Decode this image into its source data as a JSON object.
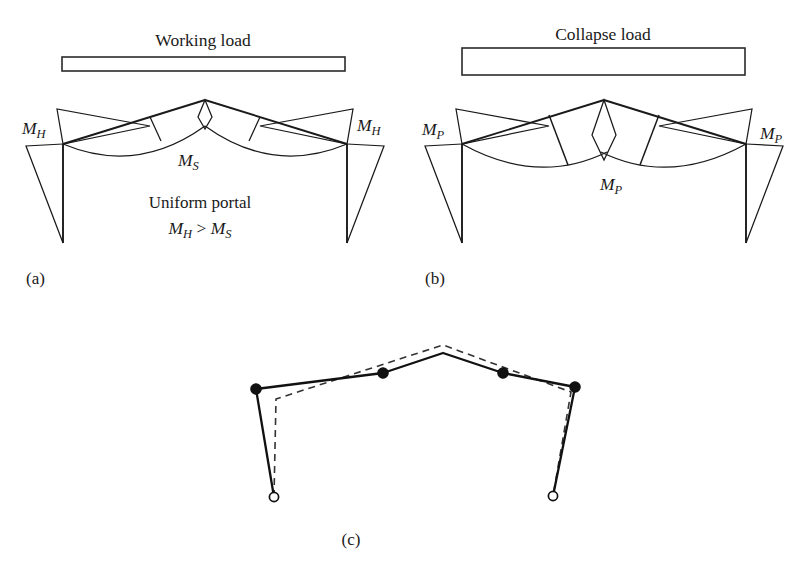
{
  "figure": {
    "domain": "engineering-diagram",
    "background": "#ffffff",
    "ink": "#1a1a1a"
  },
  "panels": [
    {
      "id": "a",
      "label": "(a)",
      "load_title": "Working load",
      "load_bar": {
        "thickness_note": "thin",
        "x": 62,
        "y": 57,
        "w": 283,
        "h": 14
      },
      "annotations": [
        {
          "name": "left-haunch-moment",
          "base": "M",
          "sub": "H",
          "x": 22,
          "y": 134
        },
        {
          "name": "apex-moment",
          "base": "M",
          "sub": "S",
          "x": 178,
          "y": 160
        },
        {
          "name": "right-haunch-moment",
          "base": "M",
          "sub": "H",
          "x": 355,
          "y": 129
        }
      ],
      "notes": [
        {
          "name": "frame-type-note",
          "text": "Uniform portal",
          "x": 200,
          "y": 205
        }
      ],
      "inequality": {
        "lhs_base": "M",
        "lhs_sub": "H",
        "op": ">",
        "rhs_base": "M",
        "rhs_sub": "S",
        "x": 200,
        "y": 230
      }
    },
    {
      "id": "b",
      "label": "(b)",
      "load_title": "Collapse load",
      "load_bar": {
        "thickness_note": "thick",
        "x": 462,
        "y": 48,
        "w": 283,
        "h": 27
      },
      "annotations": [
        {
          "name": "left-haunch-moment",
          "base": "M",
          "sub": "P",
          "x": 424,
          "y": 133
        },
        {
          "name": "apex-moment",
          "base": "M",
          "sub": "P",
          "x": 600,
          "y": 185
        },
        {
          "name": "right-haunch-moment",
          "base": "M",
          "sub": "P",
          "x": 762,
          "y": 137
        }
      ],
      "notes": [],
      "inequality": null
    },
    {
      "id": "c",
      "label": "(c)",
      "load_title": null,
      "annotations": [],
      "notes": [],
      "legend": {
        "plastic_hinge": "filled-circle",
        "pinned_base": "open-circle",
        "original_shape": "dashed-line",
        "collapsed_shape": "solid-line"
      }
    }
  ],
  "geometry": {
    "panel_a": {
      "frame_apex": [
        205,
        100
      ],
      "left_eaves": [
        63,
        144
      ],
      "right_eaves": [
        347,
        144
      ],
      "left_base": [
        63,
        243
      ],
      "right_base": [
        347,
        243
      ],
      "left_haunch_peak": [
        57,
        109
      ],
      "right_haunch_peak": [
        353,
        109
      ],
      "left_column_moment_tip": [
        26,
        146
      ],
      "right_column_moment_tip": [
        384,
        146
      ]
    },
    "panel_b": {
      "frame_apex": [
        604,
        100
      ],
      "left_eaves": [
        462,
        144
      ],
      "right_eaves": [
        746,
        144
      ],
      "left_base": [
        462,
        243
      ],
      "right_base": [
        746,
        243
      ],
      "left_haunch_peak": [
        456,
        109
      ],
      "right_haunch_peak": [
        752,
        109
      ]
    },
    "panel_c": {
      "left_eaves": [
        256,
        389
      ],
      "left_quarter": [
        383,
        373
      ],
      "apex": [
        443,
        353
      ],
      "right_quarter": [
        503,
        373
      ],
      "right_eaves": [
        575,
        387
      ],
      "left_pin": [
        274,
        497
      ],
      "right_pin": [
        553,
        496
      ],
      "hinge_radius": 5.2,
      "pin_radius": 4.6
    }
  },
  "caption": {
    "text": "",
    "visible": false
  }
}
